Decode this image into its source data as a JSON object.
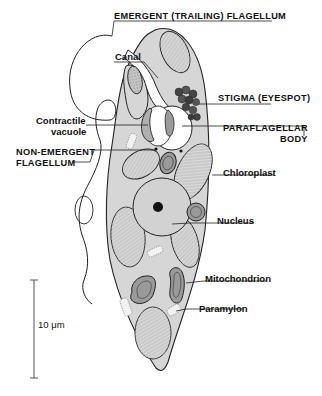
{
  "figure": {
    "labels": {
      "emergent_flagellum": "EMERGENT (TRAILING) FLAGELLUM",
      "canal": "Canal",
      "stigma": "STIGMA (EYESPOT)",
      "contractile_vacuole_line1": "Contractile",
      "contractile_vacuole_line2": "vacuole",
      "paraflagellar_line1": "PARAFLAGELLAR",
      "paraflagellar_line2": "BODY",
      "non_emergent_line1": "NON-EMERGENT",
      "non_emergent_line2": "FLAGELLUM",
      "chloroplast": "Chloroplast",
      "nucleus": "Nucleus",
      "mitochondrion": "Mitochondrion",
      "paramylon": "Paramylon"
    },
    "scale_bar": {
      "label": "10 μm"
    },
    "colors": {
      "cytoplasm": "#d6d6d6",
      "outline": "#222222",
      "stigma": "#555555",
      "background": "#ffffff"
    }
  }
}
